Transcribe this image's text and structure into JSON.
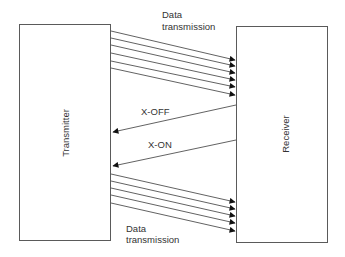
{
  "diagram": {
    "type": "flow-control sequence",
    "colors": {
      "stroke": "#3a3a3a",
      "box_border": "#5a5a5a",
      "text": "#333333",
      "background": "#ffffff"
    },
    "nodes": {
      "transmitter": {
        "label": "Transmitter"
      },
      "receiver": {
        "label": "Receiver"
      }
    },
    "labels": {
      "data_top_line1": "Data",
      "data_top_line2": "transmission",
      "x_off": "X-OFF",
      "x_on": "X-ON",
      "data_bottom_line1": "Data",
      "data_bottom_line2": "transmission"
    },
    "edges": [
      {
        "from": "Transmitter",
        "to": "Receiver",
        "label": "Data transmission",
        "count": 6
      },
      {
        "from": "Receiver",
        "to": "Transmitter",
        "label": "X-OFF",
        "count": 1
      },
      {
        "from": "Receiver",
        "to": "Transmitter",
        "label": "X-ON",
        "count": 1
      },
      {
        "from": "Transmitter",
        "to": "Receiver",
        "label": "Data transmission",
        "count": 5
      }
    ]
  }
}
